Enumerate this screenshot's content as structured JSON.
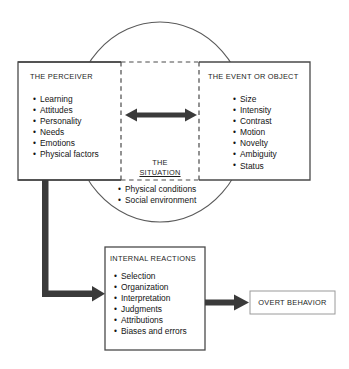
{
  "diagram": {
    "circle_label": "situation-circle",
    "colors": {
      "stroke": "#4a4a4a",
      "box_border": "#4a4a4a",
      "dashed_border": "#4a4a4a",
      "arrow": "#3a3a3a",
      "text": "#1d1d1d",
      "background": "#ffffff"
    },
    "perceiver": {
      "heading": "THE PERCEIVER",
      "items": [
        "Learning",
        "Attitudes",
        "Personality",
        "Needs",
        "Emotions",
        "Physical factors"
      ]
    },
    "event": {
      "heading": "THE EVENT OR OBJECT",
      "items": [
        "Size",
        "Intensity",
        "Contrast",
        "Motion",
        "Novelty",
        "Ambiguity",
        "Status"
      ]
    },
    "situation": {
      "heading_line1": "THE",
      "heading_line2": "SITUATION",
      "items": [
        "Physical conditions",
        "Social environment"
      ]
    },
    "internal_reactions": {
      "heading": "INTERNAL REACTIONS",
      "items": [
        "Selection",
        "Organization",
        "Interpretation",
        "Judgments",
        "Attributions",
        "Biases and errors"
      ]
    },
    "overt_behavior": {
      "label": "OVERT BEHAVIOR"
    },
    "connectors": [
      {
        "name": "perceiver-event-double-arrow",
        "type": "double-arrow"
      },
      {
        "name": "perceiver-to-internal-arrow",
        "type": "elbow-arrow"
      },
      {
        "name": "internal-to-overt-arrow",
        "type": "arrow"
      }
    ]
  }
}
